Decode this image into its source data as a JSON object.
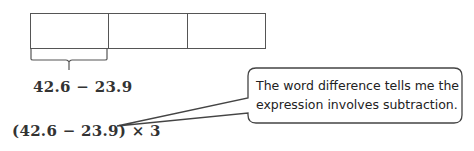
{
  "tape_diagram": {
    "segments": 3,
    "bracket_label": "42.6 − 23.9"
  },
  "expression": "(42.6 − 23.9) × 3",
  "callout": {
    "text_line1": "The word difference tells me the",
    "text_line2": "expression involves subtraction."
  },
  "colors": {
    "stroke": "#555555",
    "text": "#333333"
  }
}
